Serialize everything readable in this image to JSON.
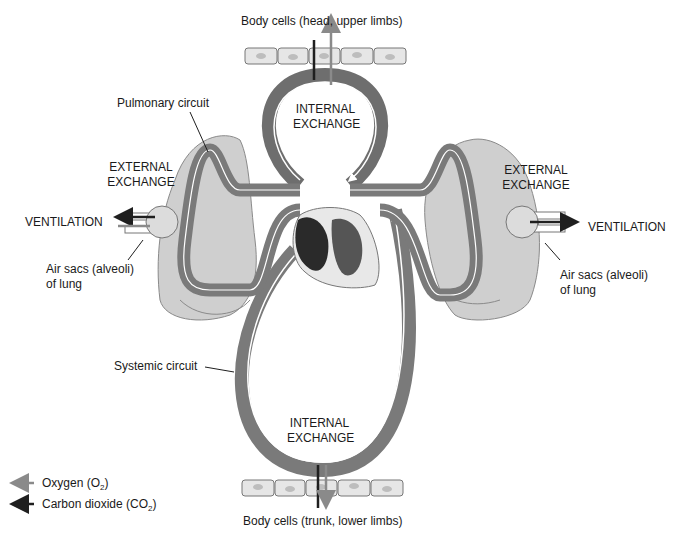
{
  "labels": {
    "top_cells": "Body cells (head, upper limbs)",
    "bottom_cells": "Body cells (trunk, lower limbs)",
    "pulmonary": "Pulmonary circuit",
    "systemic": "Systemic circuit",
    "internal_top_1": "INTERNAL",
    "internal_top_2": "EXCHANGE",
    "internal_bottom_1": "INTERNAL",
    "internal_bottom_2": "EXCHANGE",
    "external_left_1": "EXTERNAL",
    "external_left_2": "EXCHANGE",
    "external_right_1": "EXTERNAL",
    "external_right_2": "EXCHANGE",
    "ventilation_left": "VENTILATION",
    "ventilation_right": "VENTILATION",
    "alveoli_left_1": "Air sacs (alveoli)",
    "alveoli_left_2": "of lung",
    "alveoli_right_1": "Air sacs (alveoli)",
    "alveoli_right_2": "of lung"
  },
  "legend": {
    "oxygen_text": "Oxygen (O",
    "oxygen_sub": "2",
    "co2_text": "Carbon dioxide (CO",
    "co2_sub": "2",
    "close": ")"
  },
  "colors": {
    "oxygen_arrow": "#8a8a8a",
    "co2_arrow": "#1f1f1f",
    "vessel_dark": "#6e6e6e",
    "vessel_light": "#9a9a9a",
    "lung": "#c9c9c9",
    "cells": "#e6e6e6"
  }
}
